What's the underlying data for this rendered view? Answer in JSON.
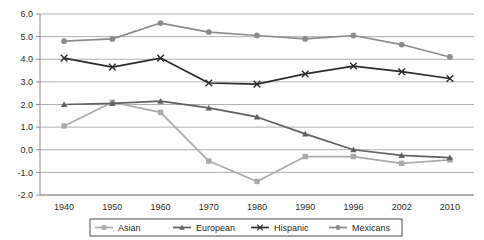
{
  "chart_data": {
    "type": "line",
    "title": "",
    "subtitle": "",
    "xlabel": "",
    "ylabel": "",
    "categories": [
      "1940",
      "1950",
      "1960",
      "1970",
      "1980",
      "1990",
      "1996",
      "2002",
      "2010"
    ],
    "x": [
      1940,
      1950,
      1960,
      1970,
      1980,
      1990,
      1996,
      2002,
      2010
    ],
    "ylim": [
      -2.0,
      6.0
    ],
    "ytick_step": 1.0,
    "yticks": [
      "6.0",
      "5.0",
      "4.0",
      "3.0",
      "2.0",
      "1.0",
      "0.0",
      "-1.0",
      "-2.0"
    ],
    "ytick_values": [
      6.0,
      5.0,
      4.0,
      3.0,
      2.0,
      1.0,
      0.0,
      -1.0,
      -2.0
    ],
    "grid": "horizontal",
    "legend_position": "bottom",
    "series": [
      {
        "name": "Asian",
        "marker": "square",
        "color": "#aaaaaa",
        "values": [
          1.05,
          2.1,
          1.65,
          -0.5,
          -1.4,
          -0.3,
          -0.3,
          -0.6,
          -0.45
        ]
      },
      {
        "name": "European",
        "marker": "triangle",
        "color": "#616161",
        "values": [
          2.0,
          2.05,
          2.15,
          1.85,
          1.45,
          0.7,
          0.0,
          -0.25,
          -0.35
        ]
      },
      {
        "name": "Hispanic",
        "marker": "x",
        "color": "#2b2b2b",
        "values": [
          4.05,
          3.65,
          4.05,
          2.95,
          2.9,
          3.35,
          3.7,
          3.45,
          3.15
        ]
      },
      {
        "name": "Mexicans",
        "marker": "circle",
        "color": "#8c8c8c",
        "values": [
          4.8,
          4.9,
          5.6,
          5.2,
          5.05,
          4.9,
          5.05,
          4.65,
          4.1
        ]
      }
    ]
  }
}
